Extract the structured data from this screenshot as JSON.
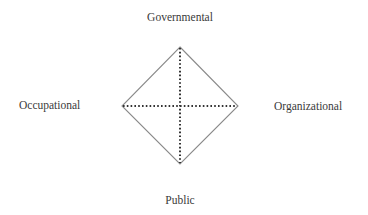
{
  "diagram": {
    "type": "diamond-with-cross-axes",
    "labels": {
      "top": "Governmental",
      "bottom": "Public",
      "left": "Occupational",
      "right": "Organizational"
    },
    "vertices": {
      "top": [
        180,
        47
      ],
      "right": [
        238,
        106
      ],
      "bottom": [
        180,
        164
      ],
      "left": [
        122,
        106
      ]
    },
    "colors": {
      "outline": "#8a8a8a",
      "axes": "#333333",
      "text": "#3a3a3a"
    }
  }
}
